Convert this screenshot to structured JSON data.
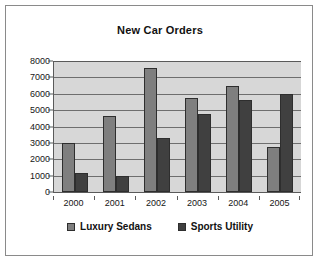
{
  "chart_data": {
    "type": "bar",
    "title": "New Car Orders",
    "xlabel": "",
    "ylabel": "",
    "categories": [
      "2000",
      "2001",
      "2002",
      "2003",
      "2004",
      "2005"
    ],
    "series": [
      {
        "name": "Luxury Sedans",
        "color": "#7f7f7f",
        "values": [
          3000,
          4650,
          7550,
          5750,
          6500,
          2750
        ]
      },
      {
        "name": "Sports Utility",
        "color": "#404040",
        "values": [
          1150,
          1000,
          3300,
          4750,
          5600,
          6000
        ]
      }
    ],
    "ylim": [
      0,
      8000
    ],
    "ytick_values": [
      0,
      1000,
      2000,
      3000,
      4000,
      5000,
      6000,
      7000,
      8000
    ],
    "ytick_labels": [
      "0",
      "1000",
      "2000",
      "3000",
      "4000",
      "5000",
      "6000",
      "7000",
      "8000"
    ],
    "grid": true,
    "grid_axis": "y",
    "legend_position": "bottom",
    "plot_background": "#d7d7d7",
    "page_background": "#ffffff"
  }
}
